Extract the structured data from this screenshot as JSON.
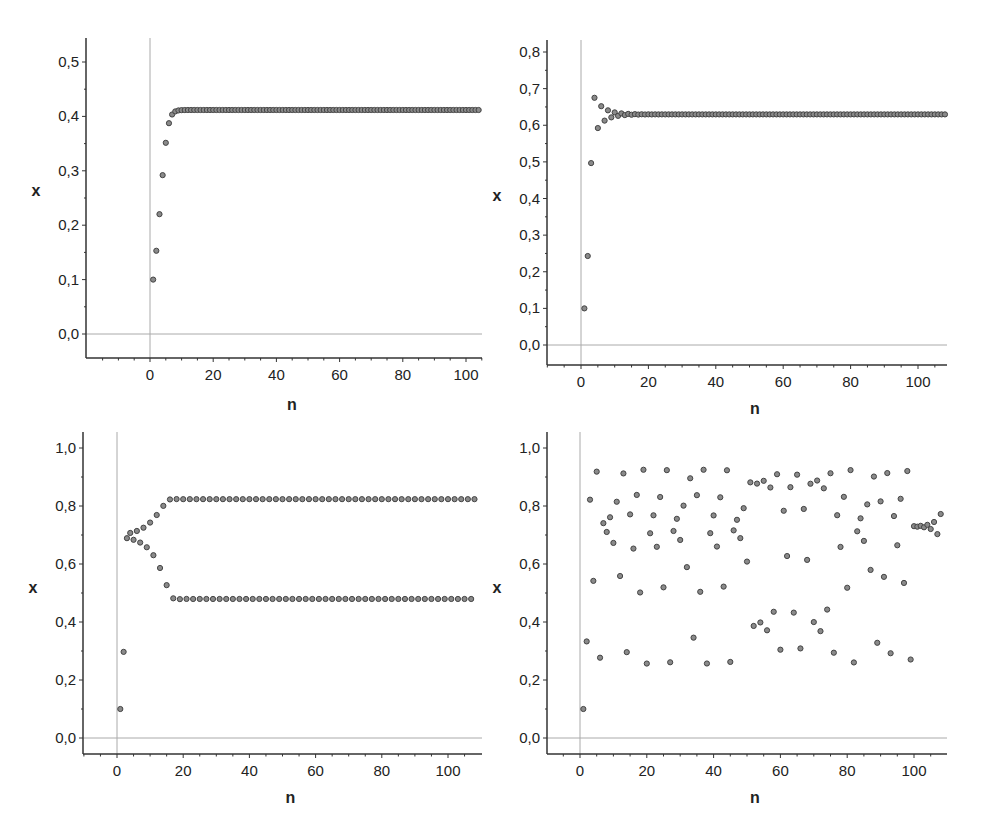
{
  "figure": {
    "panels": 4,
    "layout": "2x2 grid",
    "marker_color": "#8a8a8a",
    "marker_edge_color": "#444444",
    "axis_color": "#333333",
    "zero_line_color": "#aaaaaa"
  },
  "chart_data": [
    {
      "type": "scatter",
      "title": "",
      "xlabel": "n",
      "ylabel": "x",
      "xlim": [
        -20,
        105
      ],
      "ylim": [
        -0.05,
        0.55
      ],
      "xticks": [
        "0",
        "20",
        "40",
        "60",
        "80",
        "100"
      ],
      "yticks": [
        "0,0",
        "0,1",
        "0,2",
        "0,3",
        "0,4",
        "0,5"
      ],
      "grid": false,
      "legend": "none",
      "model": {
        "map": "logistic",
        "r": 1.7,
        "x0": 0.1,
        "n_max": 105
      },
      "x": [
        1,
        2,
        3,
        4,
        5,
        6,
        7,
        8,
        9,
        10,
        20,
        40,
        60,
        80,
        100
      ],
      "values": [
        0.1,
        0.153,
        0.22,
        0.292,
        0.351,
        0.387,
        0.403,
        0.409,
        0.411,
        0.412,
        0.412,
        0.412,
        0.412,
        0.412,
        0.412
      ],
      "steady_state": 0.412
    },
    {
      "type": "scatter",
      "title": "",
      "xlabel": "n",
      "ylabel": "x",
      "xlim": [
        -10,
        108
      ],
      "ylim": [
        -0.05,
        0.82
      ],
      "xticks": [
        "0",
        "20",
        "40",
        "60",
        "80",
        "100"
      ],
      "yticks": [
        "0,0",
        "0,1",
        "0,2",
        "0,3",
        "0,4",
        "0,5",
        "0,6",
        "0,7",
        "0,8"
      ],
      "grid": false,
      "legend": "none",
      "model": {
        "map": "logistic",
        "r": 2.7,
        "x0": 0.1,
        "n_max": 108
      },
      "x": [
        1,
        2,
        3,
        4,
        5,
        6,
        7,
        8,
        9,
        10,
        20,
        40,
        60,
        80,
        100
      ],
      "values": [
        0.1,
        0.243,
        0.497,
        0.675,
        0.592,
        0.652,
        0.613,
        0.64,
        0.622,
        0.635,
        0.63,
        0.63,
        0.63,
        0.63,
        0.63
      ],
      "steady_state": 0.63
    },
    {
      "type": "scatter",
      "title": "",
      "xlabel": "n",
      "ylabel": "x",
      "xlim": [
        -10,
        108
      ],
      "ylim": [
        -0.05,
        1.02
      ],
      "xticks": [
        "0",
        "20",
        "40",
        "60",
        "80",
        "100"
      ],
      "yticks": [
        "0,0",
        "0,2",
        "0,4",
        "0,6",
        "0,8",
        "1,0"
      ],
      "grid": false,
      "legend": "none",
      "model": {
        "map": "logistic",
        "r": 3.3,
        "x0": 0.1,
        "n_max": 108
      },
      "x": [
        1,
        2,
        3,
        4,
        5,
        6,
        7,
        8,
        9,
        10,
        11,
        12,
        13,
        14,
        15,
        16,
        17,
        18
      ],
      "values": [
        0.1,
        0.297,
        0.689,
        0.707,
        0.684,
        0.713,
        0.676,
        0.723,
        0.661,
        0.74,
        0.636,
        0.765,
        0.593,
        0.797,
        0.534,
        0.821,
        0.485,
        0.824
      ],
      "steady_state": [
        0.479,
        0.824
      ],
      "behavior": "period-2 oscillation"
    },
    {
      "type": "scatter",
      "title": "",
      "xlabel": "n",
      "ylabel": "x",
      "xlim": [
        -10,
        108
      ],
      "ylim": [
        -0.05,
        1.02
      ],
      "xticks": [
        "0",
        "20",
        "40",
        "60",
        "80",
        "100"
      ],
      "yticks": [
        "0,0",
        "0,2",
        "0,4",
        "0,6",
        "0,8",
        "1,0"
      ],
      "grid": false,
      "legend": "none",
      "model": {
        "map": "logistic",
        "r": 3.7,
        "x0": 0.1,
        "n_max": 108
      },
      "x": [
        1,
        2,
        3,
        4,
        5,
        6,
        7,
        8,
        9,
        10
      ],
      "values": [
        0.1,
        0.333,
        0.822,
        0.542,
        0.918,
        0.278,
        0.743,
        0.707,
        0.767,
        0.662
      ],
      "behavior": "chaotic, values spread between ~0.25 and ~0.93"
    }
  ]
}
